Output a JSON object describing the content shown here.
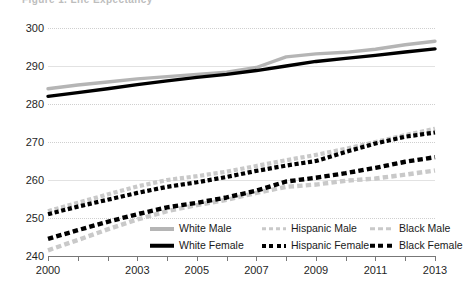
{
  "header": {
    "title_clipped": "Figure 1. Life Expectancy"
  },
  "chart_data": {
    "type": "line",
    "title": "",
    "xlabel": "",
    "ylabel": "",
    "xlim": [
      2000,
      2013
    ],
    "ylim": [
      240,
      300
    ],
    "grid": true,
    "legend_position": "bottom",
    "x": [
      2000,
      2001,
      2002,
      2003,
      2004,
      2005,
      2006,
      2007,
      2008,
      2009,
      2010,
      2011,
      2012,
      2013
    ],
    "xtick_labels": [
      "2000",
      "",
      "",
      "2003",
      "",
      "2005",
      "",
      "2007",
      "",
      "2009",
      "",
      "2011",
      "",
      "2013"
    ],
    "ytick_labels": [
      "240",
      "250",
      "260",
      "270",
      "280",
      "290",
      "300"
    ],
    "yticks": [
      240,
      250,
      260,
      270,
      280,
      290,
      300
    ],
    "series": [
      {
        "name": "White Male",
        "color": "#b5b5b5",
        "style": "solid",
        "values": [
          284.0,
          285.0,
          285.8,
          286.6,
          287.2,
          287.8,
          288.4,
          289.6,
          292.4,
          293.2,
          293.6,
          294.4,
          295.6,
          296.5
        ]
      },
      {
        "name": "White Female",
        "color": "#000000",
        "style": "solid",
        "values": [
          282.0,
          283.0,
          284.0,
          285.1,
          286.1,
          287.0,
          287.8,
          288.8,
          290.0,
          291.2,
          292.0,
          292.8,
          293.7,
          294.5
        ]
      },
      {
        "name": "Hispanic Male",
        "color": "#c9c9c9",
        "style": "dotted",
        "values": [
          251.8,
          254.0,
          256.2,
          258.3,
          260.0,
          261.0,
          262.2,
          263.7,
          265.2,
          266.6,
          268.2,
          270.0,
          271.8,
          273.5
        ]
      },
      {
        "name": "Hispanic Female",
        "color": "#000000",
        "style": "dotted",
        "values": [
          251.0,
          253.0,
          254.8,
          256.6,
          258.2,
          259.4,
          260.8,
          262.4,
          263.8,
          265.0,
          267.4,
          269.6,
          271.4,
          272.5
        ]
      },
      {
        "name": "Black Male",
        "color": "#c9c9c9",
        "style": "dashed",
        "values": [
          241.5,
          244.2,
          247.0,
          249.6,
          251.8,
          253.4,
          254.8,
          256.6,
          258.2,
          258.8,
          259.8,
          260.4,
          261.4,
          262.5
        ]
      },
      {
        "name": "Black Female",
        "color": "#000000",
        "style": "dashed",
        "values": [
          244.5,
          246.8,
          249.0,
          251.0,
          252.8,
          254.0,
          255.4,
          257.2,
          259.6,
          260.6,
          261.8,
          263.2,
          264.8,
          266.0
        ]
      }
    ],
    "legend": [
      {
        "label": "White Male",
        "swatch": "solid-gray"
      },
      {
        "label": "Hispanic Male",
        "swatch": "dotted-gray"
      },
      {
        "label": "Black Male",
        "swatch": "dashed-gray"
      },
      {
        "label": "White Female",
        "swatch": "solid-black"
      },
      {
        "label": "Hispanic Female",
        "swatch": "dotted-black"
      },
      {
        "label": "Black Female",
        "swatch": "dashed-black"
      }
    ]
  }
}
